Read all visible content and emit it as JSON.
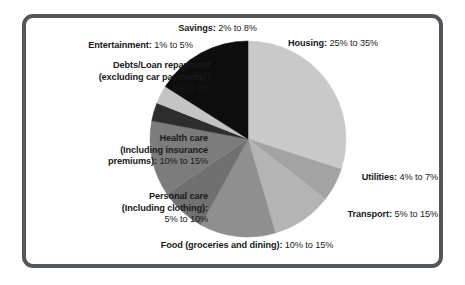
{
  "frame": {
    "border_color": "#53565a",
    "background": "#ffffff"
  },
  "chart_data": {
    "type": "pie",
    "title": "",
    "subtitle": "",
    "xlabel": "",
    "ylabel": "",
    "legend_position": "labels-around-pie",
    "grid": false,
    "label_format": "{category}: {low}% to {high}%",
    "categories": [
      "Housing",
      "Utilities",
      "Transport",
      "Food (groceries and dining)",
      "Personal care (Including clothing)",
      "Health care (Including insurance premiums)",
      "Debts/Loan repayment (excluding car payments)",
      "Entertainment",
      "Savings"
    ],
    "values": [
      30,
      5.5,
      10,
      12.5,
      7.5,
      12.5,
      3,
      3,
      5
    ],
    "ranges": [
      {
        "low": 25,
        "high": 35
      },
      {
        "low": 4,
        "high": 7
      },
      {
        "low": 5,
        "high": 15
      },
      {
        "low": 10,
        "high": 15
      },
      {
        "low": 5,
        "high": 10
      },
      {
        "low": 10,
        "high": 15
      },
      {
        "low": 1,
        "high": 5
      },
      {
        "low": 1,
        "high": 5
      },
      {
        "low": 2,
        "high": 8
      }
    ],
    "colors": [
      "#c9c9c9",
      "#a3a3a3",
      "#b4b4b4",
      "#8f8f8f",
      "#707070",
      "#7c7c7c",
      "#2e2e2e",
      "#c4c4c4",
      "#0d0d0d"
    ],
    "slices": [
      {
        "name": "Housing",
        "value": 30,
        "color": "#c9c9c9",
        "start_deg": 0,
        "end_deg": 108
      },
      {
        "name": "Utilities",
        "value": 5.5,
        "color": "#a3a3a3",
        "start_deg": 108,
        "end_deg": 127.8
      },
      {
        "name": "Transport",
        "value": 10,
        "color": "#b4b4b4",
        "start_deg": 127.8,
        "end_deg": 163.8
      },
      {
        "name": "Food",
        "value": 12.5,
        "color": "#8f8f8f",
        "start_deg": 163.8,
        "end_deg": 208.8
      },
      {
        "name": "Personal care",
        "value": 7.5,
        "color": "#707070",
        "start_deg": 208.8,
        "end_deg": 235.8
      },
      {
        "name": "Health care",
        "value": 12.5,
        "color": "#7c7c7c",
        "start_deg": 235.8,
        "end_deg": 280.8
      },
      {
        "name": "Debts/Loan",
        "value": 3,
        "color": "#2e2e2e",
        "start_deg": 280.8,
        "end_deg": 291.6
      },
      {
        "name": "Entertainment",
        "value": 3,
        "color": "#c4c4c4",
        "start_deg": 291.6,
        "end_deg": 302.4
      },
      {
        "name": "Savings",
        "value": 5,
        "color": "#0d0d0d",
        "start_deg": 302.4,
        "end_deg": 360
      }
    ],
    "geometry": {
      "cx": 248,
      "cy": 139,
      "r": 98
    }
  },
  "labels": {
    "savings": {
      "cat": "Savings:",
      "val": " 2% to 8%"
    },
    "entertainment": {
      "cat": "Entertainment:",
      "val": " 1% to 5%"
    },
    "debts": {
      "line1": "Debts/Loan repayment",
      "line2": "(excluding car payments):",
      "line3": "1% to 5%"
    },
    "health": {
      "line1": "Health care",
      "line2": "(Including insurance",
      "line3_cat": "premiums):",
      "line3_val": " 10% to 15%"
    },
    "personal": {
      "line1": "Personal care",
      "line2": "(Including clothing):",
      "line3": "5% to 10%"
    },
    "food": {
      "cat": "Food (groceries and dining):",
      "val": " 10% to 15%"
    },
    "housing": {
      "cat": "Housing:",
      "val": " 25% to 35%"
    },
    "utilities": {
      "cat": "Utilities:",
      "val": " 4% to 7%"
    },
    "transport": {
      "cat": "Transport:",
      "val": " 5% to 15%"
    }
  }
}
